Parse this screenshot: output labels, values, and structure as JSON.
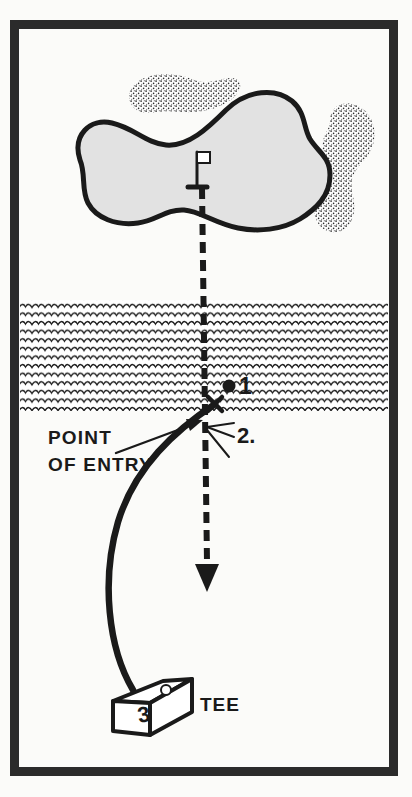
{
  "figure": {
    "frame_color": "#2b2b2b",
    "paper_color": "#fbfbf9",
    "ink_color": "#1a1a1a",
    "green_fill": "#e2e2e2",
    "frame": {
      "x": 10,
      "y": 20,
      "width": 388,
      "height": 756,
      "stroke_width": 9
    }
  },
  "labels": {
    "point_of_entry_line1": "POINT",
    "point_of_entry_line2": "OF ENTRY",
    "marker_1": "1",
    "marker_2": "2.",
    "tee_number": "3",
    "tee_label": "TEE"
  },
  "features": {
    "green": {
      "name": "putting-green",
      "fill": "#e2e2e2",
      "stroke": "#1a1a1a",
      "stroke_width": 5,
      "path": "M 80 160 C 72 135 90 118 112 123 C 134 128 146 143 166 145 C 188 147 208 128 226 110 C 248 89 276 88 292 101 C 306 113 303 127 310 139 C 318 152 330 157 330 175 C 330 196 316 209 300 219 C 282 230 258 232 238 228 C 214 223 200 211 184 210 C 166 209 156 221 138 223 C 116 226 96 218 88 203 C 81 190 86 174 80 160 Z"
    },
    "bunkers": [
      {
        "name": "bunker-upper-left",
        "path": "M 131 104 C 126 94 131 84 142 79 C 154 73 170 73 182 76 C 192 78 198 83 208 82 C 220 81 228 76 236 79 C 244 82 240 92 232 99 C 222 107 208 111 194 112 C 180 113 170 110 158 112 C 146 114 136 113 131 104 Z",
        "stipple_density": 0.55
      },
      {
        "name": "bunker-right",
        "path": "M 330 120 C 330 108 340 102 352 104 C 364 106 372 116 374 128 C 376 140 372 150 366 158 C 360 166 354 170 352 180 C 350 192 356 200 354 212 C 352 226 342 234 331 232 C 320 230 314 220 314 208 C 314 196 320 188 322 178 C 324 166 320 158 322 146 C 324 132 330 130 330 120 Z",
        "stipple_density": 0.55
      }
    ],
    "water_hazard": {
      "name": "water-hazard-band",
      "top": 300,
      "bottom": 411,
      "left": 20,
      "right": 388,
      "wave_row_height": 8.6,
      "wave_width": 13
    },
    "flagstick": {
      "name": "flagstick",
      "pole_x": 197,
      "pole_top": 152,
      "pole_bottom": 187,
      "flag_width": 13,
      "flag_height": 11
    },
    "dashed_line": {
      "name": "flagstick-to-arrow-dashed-line",
      "x": 205,
      "top": 186,
      "bottom": 565,
      "dash": "11 7",
      "stroke_width": 6
    },
    "arrow_head": {
      "name": "direction-arrow-head",
      "tip_x": 207,
      "tip_y": 590,
      "half_width": 11,
      "height": 24
    },
    "ball_flight": {
      "name": "ball-flight-path",
      "path": "M 133 690 C 108 648 101 580 118 522 C 135 466 176 430 215 404",
      "stroke_width": 6.5
    },
    "ball_marker": {
      "name": "ball-dot-1",
      "cx": 229,
      "cy": 386,
      "r": 6.5
    },
    "entry_cross": {
      "name": "point-of-entry-cross",
      "cx": 215,
      "cy": 404
    },
    "pointer_arrow": {
      "name": "point-of-entry-pointer-arrow",
      "path": "M 118 452 L 192 424",
      "tip_x": 201,
      "tip_y": 420
    },
    "fan_lines": {
      "name": "reference-fan-lines-2",
      "origin_x": 207,
      "origin_y": 427,
      "rays": [
        {
          "x": 233,
          "y": 424
        },
        {
          "x": 233,
          "y": 436
        },
        {
          "x": 228,
          "y": 455
        }
      ]
    },
    "tee_box": {
      "name": "tee-box",
      "top_face": "M 113 701 L 163 681 L 192 679 L 150 703 Z",
      "front_face": "M 113 701 L 150 703 L 150 735 L 113 731 Z",
      "side_face": "M 150 703 L 192 679 L 192 712 L 150 735 Z",
      "marker_circle": {
        "cx": 166,
        "cy": 690,
        "r": 5
      }
    }
  }
}
